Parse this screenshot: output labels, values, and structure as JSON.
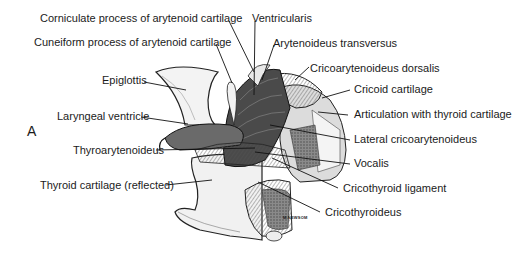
{
  "figure": {
    "panel_letter": "A",
    "signature": "M.NEWSOM",
    "labels": [
      {
        "id": "corniculate",
        "text": "Corniculate process of arytenoid cartilage"
      },
      {
        "id": "ventricularis",
        "text": "Ventricularis"
      },
      {
        "id": "cuneiform",
        "text": "Cuneiform process of arytenoid cartilage"
      },
      {
        "id": "arytenoideus-transversus",
        "text": "Arytenoideus transversus"
      },
      {
        "id": "epiglottis",
        "text": "Epiglottis"
      },
      {
        "id": "cricoarytenoideus-dorsalis",
        "text": "Cricoarytenoideus dorsalis"
      },
      {
        "id": "cricoid-cartilage",
        "text": "Cricoid cartilage"
      },
      {
        "id": "laryngeal-ventricle",
        "text": "Laryngeal ventricle"
      },
      {
        "id": "articulation-thyroid",
        "text": "Articulation with thyroid cartilage"
      },
      {
        "id": "lateral-cricoarytenoideus",
        "text": "Lateral cricoarytenoideus"
      },
      {
        "id": "thyroarytenoideus",
        "text": "Thyroarytenoideus"
      },
      {
        "id": "vocalis",
        "text": "Vocalis"
      },
      {
        "id": "thyroid-cartilage",
        "text": "Thyroid cartilage (reflected)"
      },
      {
        "id": "cricothyroid-ligament",
        "text": "Cricothyroid ligament"
      },
      {
        "id": "cricothyroideus",
        "text": "Cricothyroideus"
      }
    ]
  }
}
